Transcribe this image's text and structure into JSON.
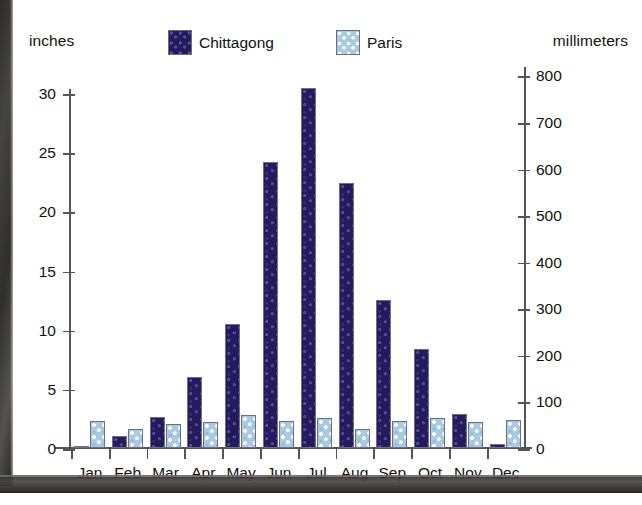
{
  "chart_data": {
    "type": "bar",
    "title": "",
    "categories": [
      "Jan",
      "Feb",
      "Mar",
      "Apr",
      "May",
      "Jun",
      "Jul",
      "Aug",
      "Sep",
      "Oct",
      "Nov",
      "Dec"
    ],
    "series": [
      {
        "name": "Chittagong",
        "color": "#241a5e",
        "values": [
          0.2,
          1.0,
          2.6,
          6.0,
          10.5,
          24.2,
          30.4,
          22.4,
          12.5,
          8.4,
          2.9,
          0.3
        ]
      },
      {
        "name": "Paris",
        "color": "#a9cbe2",
        "values": [
          2.3,
          1.6,
          2.0,
          2.2,
          2.8,
          2.3,
          2.5,
          1.6,
          2.3,
          2.5,
          2.2,
          2.4
        ]
      }
    ],
    "xlabel": "",
    "ylabel": "inches",
    "ylabel_right": "millimeters",
    "ylim": [
      0,
      32
    ],
    "ylim_right": [
      0,
      812
    ],
    "yticks": [
      0,
      5,
      10,
      15,
      20,
      25,
      30
    ],
    "yticks_right": [
      0,
      100,
      200,
      300,
      400,
      500,
      600,
      700,
      800
    ],
    "grid": false,
    "legend_position": "top-center"
  },
  "header": {
    "left_axis_title": "inches",
    "right_axis_title": "millimeters"
  },
  "legend": {
    "items": [
      {
        "label": "Chittagong",
        "swatch": "chittagong-swatch"
      },
      {
        "label": "Paris",
        "swatch": "paris-swatch"
      }
    ]
  }
}
